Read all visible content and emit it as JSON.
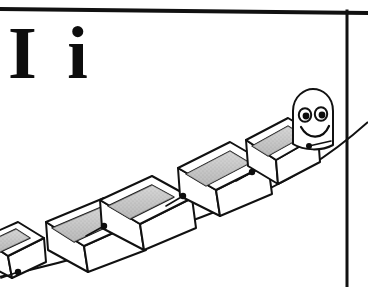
{
  "card": {
    "letters": "I i",
    "uppercase": "I",
    "lowercase": "i",
    "subject": "inchworm",
    "style": "black-and-white line drawing"
  },
  "colors": {
    "ink": "#0d0d0d",
    "paper": "#ffffff",
    "band_light": "#d8d8d8",
    "band_mid": "#b9b9b9",
    "band_dark": "#9a9a9a",
    "rule": "#111111"
  },
  "frame": {
    "top_rule": {
      "x1": 0,
      "y1": 8,
      "x2": 368,
      "y2": 12,
      "width": 4
    },
    "right_rule": {
      "x1": 347,
      "y1": 10,
      "x2": 347,
      "y2": 287,
      "width": 3
    }
  },
  "ground": {
    "label": "ground-line",
    "path": "M -6 278 C 70 262, 150 238, 230 206 C 290 182, 330 156, 368 122"
  },
  "inchworm": {
    "label": "inchworm-figure",
    "segment_count": 5,
    "segments": [
      {
        "name": "segment-tail",
        "top_face": "M -18 238 L 18 222 L 44 238 L 8 256 Z",
        "band": "M -14 243 L 16 229 L 30 238 L 0 252 Z",
        "front_face": "M 8 256 L 44 238 L 46 262 L 12 278 Z",
        "fold_face": "M -18 238 L 8 256 L 12 278 L -18 262 Z",
        "foot": {
          "cx": 18,
          "cy": 272,
          "r": 3.2
        },
        "foot_stem": "M 18 272 L 2 278"
      },
      {
        "name": "segment-2",
        "top_face": "M 46 222 L 104 198 L 142 220 L 84 246 Z",
        "band": "M 52 228 L 104 206 L 124 219 L 74 242 Z",
        "front_face": "M 84 246 L 142 220 L 146 250 L 88 272 Z",
        "fold_face": "M 46 222 L 84 246 L 88 272 L 48 250 Z",
        "foot": {
          "cx": 104,
          "cy": 226,
          "r": 3.2
        },
        "foot_stem": "M 104 226 L 86 236"
      },
      {
        "name": "segment-3",
        "top_face": "M 100 200 L 152 176 L 192 198 L 140 224 Z",
        "band": "M 108 206 L 152 185 L 174 197 L 130 219 Z",
        "front_face": "M 140 224 L 192 198 L 196 228 L 144 250 Z",
        "fold_face": "M 100 200 L 140 224 L 144 250 L 102 228 Z",
        "foot": {
          "cx": 183,
          "cy": 196,
          "r": 3.2
        },
        "foot_stem": "M 183 196 L 166 206"
      },
      {
        "name": "segment-4",
        "top_face": "M 178 168 L 230 142 L 268 164 L 216 190 Z",
        "band": "M 186 174 L 230 151 L 250 163 L 206 186 Z",
        "front_face": "M 216 190 L 268 164 L 272 194 L 220 216 Z",
        "fold_face": "M 178 168 L 216 190 L 220 216 L 180 196 Z",
        "foot": {
          "cx": 252,
          "cy": 172,
          "r": 3.2
        },
        "foot_stem": "M 252 172 L 236 181"
      },
      {
        "name": "segment-5",
        "top_face": "M 246 140 L 288 118 L 318 136 L 276 160 Z",
        "band": "M 252 146 L 288 126 L 304 136 L 268 156 Z",
        "front_face": "M 276 160 L 318 136 L 320 162 L 278 184 Z",
        "fold_face": "M 246 140 L 276 160 L 278 184 L 248 166 Z",
        "foot": {
          "cx": 311,
          "cy": 152,
          "r": 3.2
        },
        "foot_stem": "M 311 152 L 296 160"
      }
    ],
    "head": {
      "name": "inchworm-head",
      "outline": "M 293 144 L 293 111 C 293 96, 305 90, 313 90 C 322 90, 333 96, 333 111 L 333 144 C 322 150, 304 150, 293 144 Z",
      "eye_left": {
        "cx": 305,
        "cy": 115,
        "rx": 6.2,
        "ry": 6.8
      },
      "eye_right": {
        "cx": 321,
        "cy": 114,
        "rx": 6.2,
        "ry": 6.8
      },
      "pupil_left": {
        "cx": 306,
        "cy": 116,
        "r": 3.4
      },
      "pupil_right": {
        "cx": 322,
        "cy": 115,
        "r": 3.4
      },
      "smile": "M 302 128 C 308 139, 322 139, 328 127",
      "chin_dot": {
        "cx": 309,
        "cy": 146,
        "r": 3.0
      },
      "chin_stem": "M 309 146 L 330 141"
    }
  }
}
